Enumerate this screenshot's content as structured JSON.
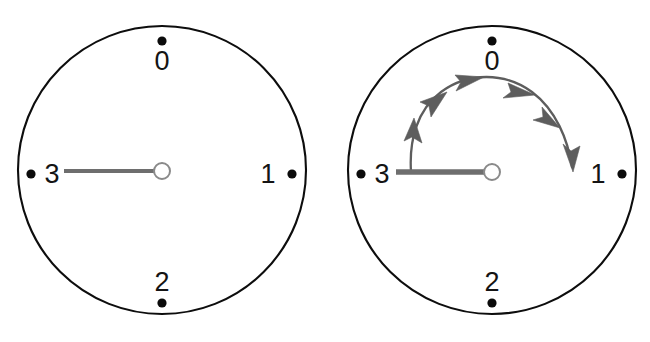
{
  "figure": {
    "background_color": "#ffffff",
    "panel_count": 2
  },
  "style": {
    "dial_stroke_color": "#0d0d0d",
    "dot_color": "#0b0b0b",
    "label_color": "#141414",
    "pointer_color": "#6e6e6e",
    "hub_fill_color": "#ffffff",
    "hub_stroke_color": "#8a8a8a",
    "arrow_color": "#5d5d5d"
  },
  "panels": [
    {
      "id": "panel-before",
      "name": "dial-before-rotation",
      "center": {
        "x": 162,
        "y": 170
      },
      "radius": 144,
      "pointer": {
        "points_to": "3",
        "angle_deg": 270,
        "length": 98,
        "hub_radius": 8
      },
      "positions": [
        {
          "label": "0",
          "angle_deg": 0,
          "dot": {
            "x": 162,
            "y": 41
          },
          "text": {
            "x": 162,
            "y": 70
          }
        },
        {
          "label": "1",
          "angle_deg": 90,
          "dot": {
            "x": 292,
            "y": 174
          },
          "text": {
            "x": 268,
            "y": 183
          }
        },
        {
          "label": "2",
          "angle_deg": 180,
          "dot": {
            "x": 162,
            "y": 303
          },
          "text": {
            "x": 162,
            "y": 291
          }
        },
        {
          "label": "3",
          "angle_deg": 270,
          "dot": {
            "x": 31,
            "y": 174
          },
          "text": {
            "x": 52,
            "y": 183
          }
        }
      ],
      "arc": null
    },
    {
      "id": "panel-after",
      "name": "dial-with-rotation-arrow",
      "center": {
        "x": 492,
        "y": 170
      },
      "radius": 144,
      "pointer": {
        "points_to": "3",
        "angle_deg": 270,
        "length": 98,
        "hub_radius": 8
      },
      "positions": [
        {
          "label": "0",
          "angle_deg": 0,
          "dot": {
            "x": 492,
            "y": 41
          },
          "text": {
            "x": 492,
            "y": 70
          }
        },
        {
          "label": "1",
          "angle_deg": 90,
          "dot": {
            "x": 622,
            "y": 174
          },
          "text": {
            "x": 598,
            "y": 183
          }
        },
        {
          "label": "2",
          "angle_deg": 180,
          "dot": {
            "x": 492,
            "y": 303
          },
          "text": {
            "x": 492,
            "y": 291
          }
        },
        {
          "label": "3",
          "angle_deg": 270,
          "dot": {
            "x": 361,
            "y": 174
          },
          "text": {
            "x": 382,
            "y": 183
          }
        }
      ],
      "arc": {
        "name": "clockwise-rotation-arc",
        "direction": "clockwise",
        "from_position": "3",
        "to_position": "1",
        "sweep_deg": 180,
        "arc_radius": 84,
        "arrowhead_count": 5,
        "arrowhead_angles_deg": [
          235,
          285,
          325,
          15,
          65
        ]
      }
    }
  ]
}
